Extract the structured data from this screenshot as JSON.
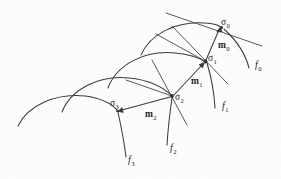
{
  "figure": {
    "type": "mathematical-diagram",
    "background_color": "#fdfdfd",
    "ink_color": "#3a3a3a",
    "width": 281,
    "height": 179
  },
  "junction_labels": [
    {
      "id": "sigma-0",
      "base": "σ",
      "sub": "0",
      "x": 221,
      "y": 18
    },
    {
      "id": "sigma-1",
      "base": "σ",
      "sub": "1",
      "x": 208,
      "y": 54
    },
    {
      "id": "sigma-2",
      "base": "σ",
      "sub": "2",
      "x": 175,
      "y": 93
    },
    {
      "id": "sigma-3",
      "base": "σ",
      "sub": "3",
      "x": 110,
      "y": 99
    }
  ],
  "vector_labels": [
    {
      "id": "m-0",
      "base": "m",
      "sub": "0",
      "x": 218,
      "y": 41
    },
    {
      "id": "m-1",
      "base": "m",
      "sub": "1",
      "x": 191,
      "y": 77
    },
    {
      "id": "m-2",
      "base": "m",
      "sub": "2",
      "x": 145,
      "y": 110
    }
  ],
  "curve_labels": [
    {
      "id": "f-0",
      "base": "f",
      "sub": "0",
      "x": 255,
      "y": 60
    },
    {
      "id": "f-1",
      "base": "f",
      "sub": "1",
      "x": 222,
      "y": 101
    },
    {
      "id": "f-2",
      "base": "f",
      "sub": "2",
      "x": 170,
      "y": 143
    },
    {
      "id": "f-3",
      "base": "f",
      "sub": "3",
      "x": 128,
      "y": 155
    }
  ]
}
